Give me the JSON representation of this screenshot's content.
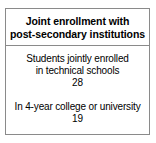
{
  "card": {
    "header": {
      "title_line_1": "Joint enrollment with",
      "title_line_2": "post-secondary institutions"
    },
    "stats": [
      {
        "label_line_1": "Students jointly enrolled",
        "label_line_2": "in technical schools",
        "value": "28"
      },
      {
        "label_line_1": "In 4-year college or university",
        "label_line_2": "",
        "value": "19"
      }
    ]
  },
  "colors": {
    "border": "#8a8a8a",
    "text": "#000000",
    "background": "#ffffff"
  }
}
